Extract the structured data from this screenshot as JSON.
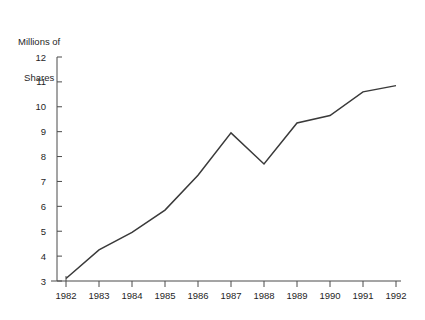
{
  "chart_data": {
    "type": "line",
    "title": "",
    "ylabel_lines": [
      "Millions of",
      "Shares"
    ],
    "xlabel": "",
    "x": [
      1982,
      1983,
      1984,
      1985,
      1986,
      1987,
      1988,
      1989,
      1990,
      1991,
      1992
    ],
    "categories": [
      "1982",
      "1983",
      "1984",
      "1985",
      "1986",
      "1987",
      "1988",
      "1989",
      "1990",
      "1991",
      "1992"
    ],
    "values": [
      3.1,
      4.25,
      4.95,
      5.85,
      7.25,
      8.95,
      7.7,
      9.35,
      9.65,
      10.6,
      10.85
    ],
    "series": [
      {
        "name": "Millions of Shares",
        "values": [
          3.1,
          4.25,
          4.95,
          5.85,
          7.25,
          8.95,
          7.7,
          9.35,
          9.65,
          10.6,
          10.85
        ]
      }
    ],
    "ylim": [
      3,
      12
    ],
    "yticks": [
      3,
      4,
      5,
      6,
      7,
      8,
      9,
      10,
      11,
      12
    ],
    "ytick_labels": [
      "3",
      "4",
      "5",
      "6",
      "7",
      "8",
      "9",
      "10",
      "11",
      "12"
    ],
    "xtick_labels": [
      "1982",
      "1983",
      "1984",
      "1985",
      "1986",
      "1987",
      "1988",
      "1989",
      "1990",
      "1991",
      "1992"
    ],
    "grid": false,
    "legend": "none",
    "line_color": "#3a3a3a",
    "axis_color": "#4a4a4a",
    "background_color": "#ffffff"
  }
}
